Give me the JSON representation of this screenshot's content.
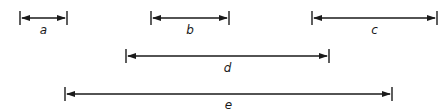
{
  "diagram": {
    "type": "dimension-segments",
    "stroke_color": "#1a1a1a",
    "segments": [
      {
        "label": "a",
        "x1": 20,
        "x2": 67,
        "y": 18,
        "label_y": 24
      },
      {
        "label": "b",
        "x1": 151,
        "x2": 229,
        "y": 18,
        "label_y": 24
      },
      {
        "label": "c",
        "x1": 312,
        "x2": 437,
        "y": 18,
        "label_y": 24
      },
      {
        "label": "d",
        "x1": 126,
        "x2": 329,
        "y": 56,
        "label_y": 62
      },
      {
        "label": "e",
        "x1": 65,
        "x2": 392,
        "y": 94,
        "label_y": 99
      }
    ]
  }
}
